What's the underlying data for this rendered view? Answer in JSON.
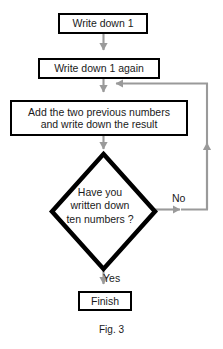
{
  "figure": {
    "caption": "Fig. 3",
    "colors": {
      "node_border": "#000000",
      "node_fill": "#ffffff",
      "connector": "#9a9a9a",
      "text": "#1a1a1a",
      "background": "#ffffff"
    }
  },
  "nodes": {
    "start": {
      "type": "process",
      "label": "Write down 1"
    },
    "second": {
      "type": "process",
      "label": "Write down 1 again"
    },
    "add": {
      "type": "process",
      "label": "Add the two previous numbers\nand write down the result"
    },
    "decision": {
      "type": "decision",
      "label": "Have you\nwritten down\nten numbers ?"
    },
    "finish": {
      "type": "terminator",
      "label": "Finish"
    }
  },
  "edges": {
    "start_to_second": {
      "label": ""
    },
    "second_to_add": {
      "label": ""
    },
    "add_to_decision": {
      "label": ""
    },
    "decision_no": {
      "label": "No"
    },
    "decision_yes": {
      "label": "Yes"
    },
    "loop_back": {
      "label": ""
    }
  }
}
